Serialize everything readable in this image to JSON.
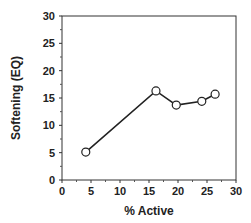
{
  "chart_data": {
    "type": "line",
    "title": "",
    "xlabel": "% Active",
    "ylabel": "Softening (EQ)",
    "xlim": [
      0,
      30
    ],
    "ylim": [
      0,
      30
    ],
    "xticks": [
      0,
      5,
      10,
      15,
      20,
      25,
      30
    ],
    "yticks": [
      0,
      5,
      10,
      15,
      20,
      25,
      30
    ],
    "grid": false,
    "legend": null,
    "series": [
      {
        "name": "Softening",
        "marker": "open-circle",
        "color": "#222222",
        "x": [
          4.1,
          16.2,
          19.7,
          24.1,
          26.4
        ],
        "y": [
          5.1,
          16.3,
          13.7,
          14.4,
          15.7
        ]
      }
    ]
  },
  "layout": {
    "plot": {
      "left": 62,
      "right": 236,
      "top": 16,
      "bottom": 180
    }
  }
}
